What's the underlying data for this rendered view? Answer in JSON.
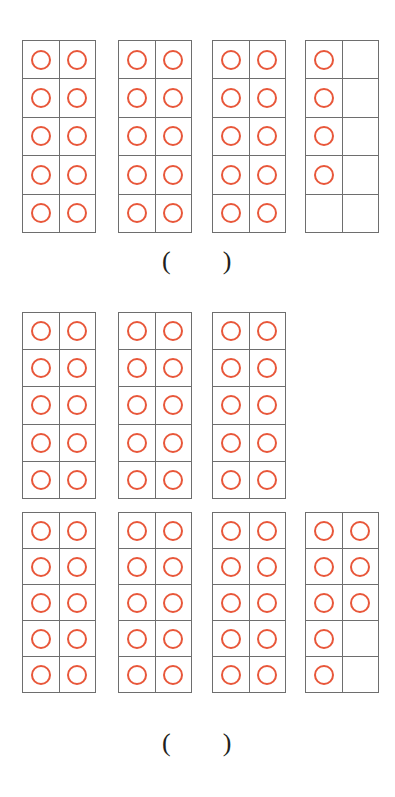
{
  "page": {
    "background_color": "#ffffff"
  },
  "style": {
    "counter_color": "#e8573a",
    "grid_line_color": "#6e6e6e",
    "text_color": "#231f20"
  },
  "symbols": {
    "open_paren": "(",
    "close_paren": ")",
    "counter_icon": "open-circle-counter"
  },
  "problems": [
    {
      "id": "problem-1",
      "total_counters": 34,
      "frames": [
        {
          "id": "row1-frame-1",
          "filled": 10,
          "cells": [
            1,
            1,
            1,
            1,
            1,
            1,
            1,
            1,
            1,
            1
          ]
        },
        {
          "id": "row1-frame-2",
          "filled": 10,
          "cells": [
            1,
            1,
            1,
            1,
            1,
            1,
            1,
            1,
            1,
            1
          ]
        },
        {
          "id": "row1-frame-3",
          "filled": 10,
          "cells": [
            1,
            1,
            1,
            1,
            1,
            1,
            1,
            1,
            1,
            1
          ]
        },
        {
          "id": "row1-frame-4",
          "filled": 4,
          "cells": [
            1,
            0,
            1,
            0,
            1,
            0,
            1,
            0,
            0,
            0
          ]
        }
      ],
      "answer_value": ""
    },
    {
      "id": "problem-2",
      "total_counters": 30,
      "frames": [
        {
          "id": "row2-frame-1",
          "filled": 10,
          "cells": [
            1,
            1,
            1,
            1,
            1,
            1,
            1,
            1,
            1,
            1
          ]
        },
        {
          "id": "row2-frame-2",
          "filled": 10,
          "cells": [
            1,
            1,
            1,
            1,
            1,
            1,
            1,
            1,
            1,
            1
          ]
        },
        {
          "id": "row2-frame-3",
          "filled": 10,
          "cells": [
            1,
            1,
            1,
            1,
            1,
            1,
            1,
            1,
            1,
            1
          ]
        }
      ],
      "answer_value": null
    },
    {
      "id": "problem-3",
      "total_counters": 38,
      "frames": [
        {
          "id": "row3-frame-1",
          "filled": 10,
          "cells": [
            1,
            1,
            1,
            1,
            1,
            1,
            1,
            1,
            1,
            1
          ]
        },
        {
          "id": "row3-frame-2",
          "filled": 10,
          "cells": [
            1,
            1,
            1,
            1,
            1,
            1,
            1,
            1,
            1,
            1
          ]
        },
        {
          "id": "row3-frame-3",
          "filled": 10,
          "cells": [
            1,
            1,
            1,
            1,
            1,
            1,
            1,
            1,
            1,
            1
          ]
        },
        {
          "id": "row3-frame-4",
          "filled": 8,
          "cells": [
            1,
            1,
            1,
            1,
            1,
            1,
            1,
            0,
            1,
            0
          ]
        }
      ],
      "answer_value": ""
    }
  ],
  "layout": {
    "frame_width": 74,
    "frame_height": 193,
    "columns_x": [
      22,
      118,
      212,
      305
    ],
    "rows": [
      {
        "y": 40,
        "height": 193,
        "frame_count": 4
      },
      {
        "y": 312,
        "height": 187,
        "frame_count": 3
      },
      {
        "y": 512,
        "height": 181,
        "frame_count": 4
      }
    ],
    "answer_blanks": [
      {
        "x": 162,
        "y": 248,
        "problem": 0
      },
      {
        "x": 162,
        "y": 730,
        "problem": 2
      }
    ]
  }
}
